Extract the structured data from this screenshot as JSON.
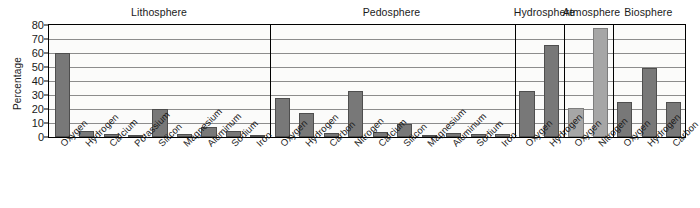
{
  "chart_data": {
    "type": "bar",
    "title": "",
    "xlabel": "",
    "ylabel": "Percentage",
    "ylim": [
      0,
      80
    ],
    "ytick_labels": [
      "80",
      "70",
      "60",
      "50",
      "40",
      "30",
      "20",
      "10",
      "0"
    ],
    "ytick_values": [
      80,
      70,
      60,
      50,
      40,
      30,
      20,
      10,
      0
    ],
    "grid": true,
    "legend": "none",
    "colors": {
      "bar_dark": "#787878",
      "bar_light": "#a6a6a6",
      "bar_border": "#4e4e4e",
      "gridline": "#8c8c8c",
      "axis": "#000000",
      "plot_background": "#fbfbfa"
    },
    "panels": [
      {
        "name": "Lithosphere",
        "shade": "dark",
        "categories": [
          "Oxygen",
          "Hydrogen",
          "Calcium",
          "Potassium",
          "Silicon",
          "Magnesium",
          "Aluminum",
          "Sodium",
          "Iron"
        ],
        "values": [
          60,
          4,
          2.5,
          1.5,
          20,
          2.5,
          7,
          4,
          1.5
        ]
      },
      {
        "name": "Pedosphere",
        "shade": "dark",
        "categories": [
          "Oxygen",
          "Hydrogen",
          "Carbon",
          "Nitrogen",
          "Calcium",
          "Silicon",
          "Magnesium",
          "Aluminum",
          "Sodium",
          "Iron"
        ],
        "values": [
          28,
          17,
          3,
          33,
          3.5,
          9,
          1,
          3,
          2,
          2
        ]
      },
      {
        "name": "Hydrosphere",
        "shade": "dark",
        "categories": [
          "Oxygen",
          "Hydrogen"
        ],
        "values": [
          33,
          66
        ]
      },
      {
        "name": "Atmosphere",
        "shade": "light",
        "categories": [
          "Oxygen",
          "Nitrogen"
        ],
        "values": [
          21,
          78
        ]
      },
      {
        "name": "Biosphere",
        "shade": "dark",
        "categories": [
          "Oxygen",
          "Hydrogen",
          "Carbon"
        ],
        "values": [
          25,
          49,
          25
        ]
      }
    ]
  }
}
